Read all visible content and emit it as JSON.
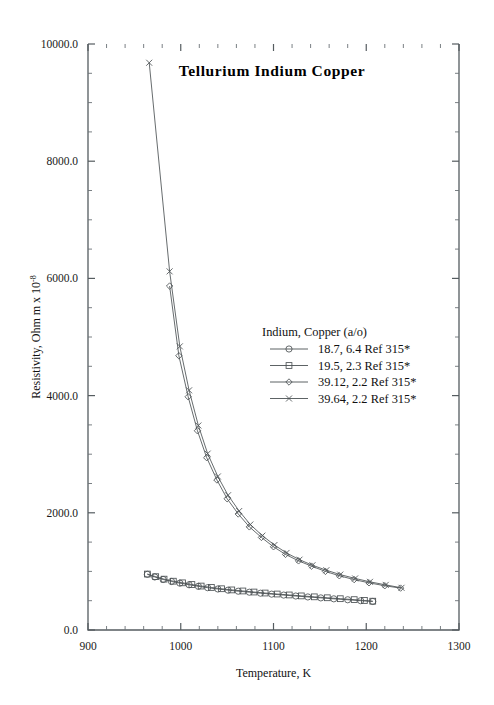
{
  "chart_data": {
    "type": "line",
    "title": "Tellurium  Indium  Copper",
    "xlabel": "Temperature,  K",
    "ylabel": "Resistivity, Ohm m x 10",
    "ylabel_exponent": "-8",
    "xlim": [
      900,
      1300
    ],
    "ylim": [
      0,
      10000
    ],
    "xticks": [
      900,
      1000,
      1100,
      1200,
      1300
    ],
    "xtick_labels": [
      "900",
      "1000",
      "1100",
      "1200",
      "1300"
    ],
    "yticks": [
      0,
      2000,
      4000,
      6000,
      8000,
      10000
    ],
    "ytick_labels": [
      "0.0",
      "2000.0",
      "4000.0",
      "6000.0",
      "8000.0",
      "10000.0"
    ],
    "x_minor_step": 20,
    "y_minor_step": 500,
    "grid": false,
    "legend_position": "center-right",
    "legend_title": "Indium, Copper (a/o)",
    "series": [
      {
        "name": "18.7, 6.4 Ref 315*",
        "marker": "circle",
        "points": [
          [
            964,
            950
          ],
          [
            972,
            905
          ],
          [
            981,
            862
          ],
          [
            990,
            828
          ],
          [
            999,
            800
          ],
          [
            1009,
            772
          ],
          [
            1019,
            745
          ],
          [
            1029,
            722
          ],
          [
            1040,
            700
          ],
          [
            1051,
            680
          ],
          [
            1062,
            662
          ],
          [
            1074,
            645
          ],
          [
            1086,
            628
          ],
          [
            1098,
            612
          ],
          [
            1111,
            596
          ],
          [
            1124,
            580
          ],
          [
            1137,
            564
          ],
          [
            1151,
            548
          ],
          [
            1165,
            532
          ],
          [
            1180,
            516
          ],
          [
            1194,
            500
          ],
          [
            1207,
            487
          ]
        ]
      },
      {
        "name": "19.5, 2.3 Ref 315*",
        "marker": "square",
        "points": [
          [
            964,
            955
          ],
          [
            973,
            910
          ],
          [
            982,
            868
          ],
          [
            992,
            833
          ],
          [
            1002,
            805
          ],
          [
            1012,
            776
          ],
          [
            1022,
            750
          ],
          [
            1033,
            726
          ],
          [
            1044,
            704
          ],
          [
            1055,
            684
          ],
          [
            1067,
            666
          ],
          [
            1079,
            648
          ],
          [
            1091,
            631
          ],
          [
            1104,
            614
          ],
          [
            1117,
            598
          ],
          [
            1130,
            582
          ],
          [
            1144,
            566
          ],
          [
            1158,
            550
          ],
          [
            1172,
            534
          ],
          [
            1187,
            518
          ],
          [
            1198,
            504
          ],
          [
            1207,
            492
          ]
        ]
      },
      {
        "name": "39.12, 2.2 Ref 315*",
        "marker": "diamond",
        "points": [
          [
            988,
            5870
          ],
          [
            998,
            4680
          ],
          [
            1008,
            3980
          ],
          [
            1018,
            3400
          ],
          [
            1028,
            2940
          ],
          [
            1039,
            2560
          ],
          [
            1050,
            2240
          ],
          [
            1062,
            1980
          ],
          [
            1074,
            1760
          ],
          [
            1087,
            1580
          ],
          [
            1100,
            1420
          ],
          [
            1113,
            1290
          ],
          [
            1127,
            1180
          ],
          [
            1141,
            1090
          ],
          [
            1156,
            1000
          ],
          [
            1171,
            925
          ],
          [
            1187,
            860
          ],
          [
            1203,
            805
          ],
          [
            1220,
            755
          ],
          [
            1237,
            715
          ]
        ]
      },
      {
        "name": "39.64, 2.2 Ref 315*",
        "marker": "cross",
        "points": [
          [
            966,
            9680
          ],
          [
            988,
            6120
          ],
          [
            999,
            4840
          ],
          [
            1009,
            4090
          ],
          [
            1019,
            3490
          ],
          [
            1029,
            3010
          ],
          [
            1040,
            2620
          ],
          [
            1051,
            2300
          ],
          [
            1063,
            2030
          ],
          [
            1075,
            1800
          ],
          [
            1088,
            1610
          ],
          [
            1101,
            1450
          ],
          [
            1114,
            1315
          ],
          [
            1128,
            1200
          ],
          [
            1142,
            1105
          ],
          [
            1157,
            1020
          ],
          [
            1172,
            945
          ],
          [
            1188,
            880
          ],
          [
            1204,
            822
          ],
          [
            1221,
            770
          ],
          [
            1238,
            720
          ]
        ]
      }
    ]
  },
  "colors": {
    "line": "#4b5154",
    "axis": "#555c60",
    "text": "#111111",
    "background": "#ffffff"
  }
}
